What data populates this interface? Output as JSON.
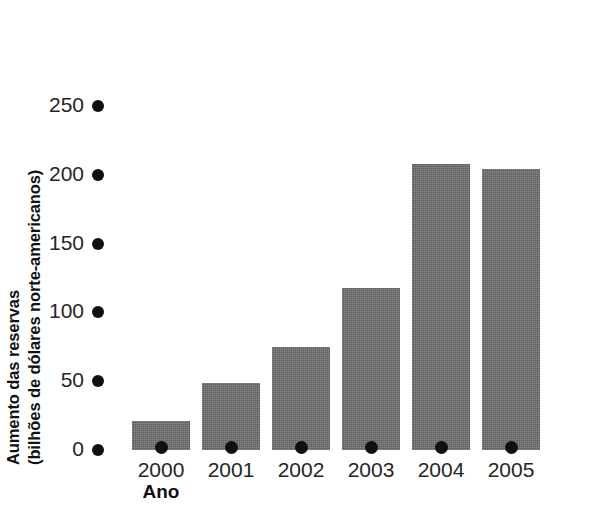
{
  "chart_data": {
    "type": "bar",
    "title": "",
    "subtitle": "",
    "xlabel": "Ano",
    "ylabel": "Aumento das reservas (bilhões de dólares norte-americanos)",
    "ylabel_lines": [
      "Aumento das reservas",
      "(bilhões de dólares norte-americanos)"
    ],
    "categories": [
      "2000",
      "2001",
      "2002",
      "2003",
      "2004",
      "2005"
    ],
    "values": [
      21,
      49,
      75,
      118,
      208,
      204
    ],
    "ylim": [
      0,
      250
    ],
    "yticks": [
      0,
      50,
      100,
      150,
      200,
      250
    ],
    "ytick_labels": [
      "0",
      "50",
      "100",
      "150",
      "200",
      "250"
    ],
    "grid": false,
    "legend": null,
    "legend_position": "none",
    "annotations": [],
    "series": [
      {
        "name": "Aumento das reservas",
        "values": [
          21,
          49,
          75,
          118,
          208,
          204
        ]
      }
    ]
  },
  "style": {
    "bar_color": "#6f6f6f",
    "marker_color": "#101010",
    "text_color": "#262626",
    "title_color": "#111111",
    "background": "#ffffff"
  }
}
